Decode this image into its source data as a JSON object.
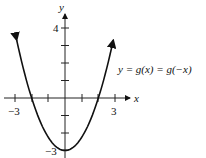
{
  "chart_data": {
    "type": "line",
    "title": "",
    "xlabel": "x",
    "ylabel": "y",
    "annotation": "y = g(x) = g(−x)",
    "xlim": [
      -3.5,
      3.5
    ],
    "ylim": [
      -3.3,
      5
    ],
    "x_ticks": [
      -3,
      -2,
      -1,
      1,
      2,
      3
    ],
    "x_tick_labels": [
      "-3",
      "3"
    ],
    "y_ticks": [
      -3,
      -2,
      -1,
      1,
      2,
      3,
      4
    ],
    "y_tick_labels": [
      "-3",
      "4"
    ],
    "grid": false,
    "series": [
      {
        "name": "g(x)",
        "x": [
          -2.9,
          -2,
          -1,
          0,
          1,
          2,
          2.9
        ],
        "values": [
          3.3,
          0,
          -2.25,
          -3,
          -2.25,
          0,
          3.3
        ]
      }
    ]
  },
  "labels": {
    "x_axis": "x",
    "y_axis": "y",
    "x_min": "−3",
    "x_max": "3",
    "y_top": "4",
    "y_bottom": "−3",
    "equation": "y = g(x) = g(−x)"
  }
}
